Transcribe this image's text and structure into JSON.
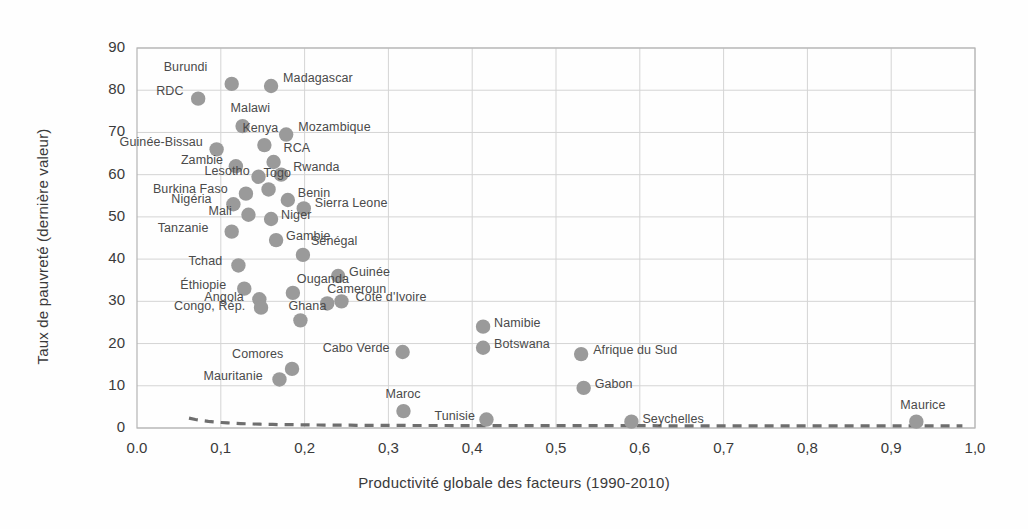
{
  "chart_data": {
    "type": "scatter",
    "title": "",
    "xlabel": "Productivité globale des facteurs (1990-2010)",
    "ylabel": "Taux de pauvreté (dernière valeur)",
    "xlim": [
      0.0,
      1.0
    ],
    "ylim": [
      0,
      90
    ],
    "xticks": [
      "0.0",
      "0,1",
      "0,2",
      "0,3",
      "0,4",
      "0,5",
      "0,6",
      "0,7",
      "0,8",
      "0,9",
      "1,0"
    ],
    "xtick_values": [
      0.0,
      0.1,
      0.2,
      0.3,
      0.4,
      0.5,
      0.6,
      0.7,
      0.8,
      0.9,
      1.0
    ],
    "yticks": [
      "0",
      "10",
      "20",
      "30",
      "40",
      "50",
      "60",
      "70",
      "80",
      "90"
    ],
    "ytick_values": [
      0,
      10,
      20,
      30,
      40,
      50,
      60,
      70,
      80,
      90
    ],
    "grid": true,
    "legend": "none",
    "marker_color": "#9a9a9a",
    "trendline": {
      "style": "dashed",
      "color": "#6e6e6e",
      "description": "Courbe de tendance décroissante"
    },
    "points": [
      {
        "label": "Burundi",
        "x": 0.113,
        "y": 81.5,
        "label_dx": -68,
        "label_dy": -17
      },
      {
        "label": "Madagascar",
        "x": 0.16,
        "y": 81.0,
        "label_dx": 12,
        "label_dy": -8
      },
      {
        "label": "RDC",
        "x": 0.073,
        "y": 78.0,
        "label_dx": -42,
        "label_dy": -8
      },
      {
        "label": "Malawi",
        "x": 0.126,
        "y": 71.5,
        "label_dx": -12,
        "label_dy": -18
      },
      {
        "label": "Mozambique",
        "x": 0.178,
        "y": 69.5,
        "label_dx": 12,
        "label_dy": -8
      },
      {
        "label": "Kenya",
        "x": 0.152,
        "y": 67.0,
        "label_dx": -22,
        "label_dy": -17
      },
      {
        "label": "Guinée-Bissau",
        "x": 0.095,
        "y": 66.0,
        "label_dx": -97,
        "label_dy": -7
      },
      {
        "label": "RCA",
        "x": 0.163,
        "y": 63.0,
        "label_dx": 10,
        "label_dy": -14
      },
      {
        "label": "Zambie",
        "x": 0.118,
        "y": 62.0,
        "label_dx": -55,
        "label_dy": -6
      },
      {
        "label": "Rwanda",
        "x": 0.172,
        "y": 60.0,
        "label_dx": 12,
        "label_dy": -8
      },
      {
        "label": "Lesotho",
        "x": 0.145,
        "y": 59.5,
        "label_dx": -54,
        "label_dy": -6
      },
      {
        "label": "Togo",
        "x": 0.157,
        "y": 56.5,
        "label_dx": -5,
        "label_dy": -16
      },
      {
        "label": "Burkina Faso",
        "x": 0.13,
        "y": 55.5,
        "label_dx": -93,
        "label_dy": -5
      },
      {
        "label": "Benin",
        "x": 0.18,
        "y": 54.0,
        "label_dx": 10,
        "label_dy": -7
      },
      {
        "label": "Nigéria",
        "x": 0.115,
        "y": 53.0,
        "label_dx": -62,
        "label_dy": -5
      },
      {
        "label": "Sierra Leone",
        "x": 0.199,
        "y": 52.0,
        "label_dx": 11,
        "label_dy": -5
      },
      {
        "label": "Mali",
        "x": 0.133,
        "y": 50.5,
        "label_dx": -40,
        "label_dy": -4
      },
      {
        "label": "Niger",
        "x": 0.16,
        "y": 49.5,
        "label_dx": 10,
        "label_dy": -4
      },
      {
        "label": "Gambie",
        "x": 0.166,
        "y": 44.5,
        "label_dx": 10,
        "label_dy": -4
      },
      {
        "label": "Tanzanie",
        "x": 0.113,
        "y": 46.5,
        "label_dx": -74,
        "label_dy": -4
      },
      {
        "label": "Sénégal",
        "x": 0.198,
        "y": 41.0,
        "label_dx": 8,
        "label_dy": -14
      },
      {
        "label": "Tchad",
        "x": 0.121,
        "y": 38.5,
        "label_dx": -50,
        "label_dy": -4
      },
      {
        "label": "Guinée",
        "x": 0.24,
        "y": 36.0,
        "label_dx": 11,
        "label_dy": -4
      },
      {
        "label": "Éthiopie",
        "x": 0.128,
        "y": 33.0,
        "label_dx": -64,
        "label_dy": -4
      },
      {
        "label": "Ouganda",
        "x": 0.186,
        "y": 32.0,
        "label_dx": 4,
        "label_dy": -14
      },
      {
        "label": "Côte d'Ivoire",
        "x": 0.244,
        "y": 30.0,
        "label_dx": 14,
        "label_dy": -4
      },
      {
        "label": "Angola",
        "x": 0.146,
        "y": 30.5,
        "label_dx": -55,
        "label_dy": -2
      },
      {
        "label": "Congo, Rép.",
        "x": 0.148,
        "y": 28.5,
        "label_dx": -87,
        "label_dy": -2
      },
      {
        "label": "Cameroun",
        "x": 0.227,
        "y": 29.5,
        "label_dx": 0,
        "label_dy": -14
      },
      {
        "label": "Namibie",
        "x": 0.413,
        "y": 24.0,
        "label_dx": 11,
        "label_dy": -4
      },
      {
        "label": "Ghana",
        "x": 0.195,
        "y": 25.5,
        "label_dx": -12,
        "label_dy": -14
      },
      {
        "label": "Botswana",
        "x": 0.413,
        "y": 19.0,
        "label_dx": 11,
        "label_dy": -4
      },
      {
        "label": "Afrique du Sud",
        "x": 0.53,
        "y": 17.5,
        "label_dx": 12,
        "label_dy": -4
      },
      {
        "label": "Cabo Verde",
        "x": 0.317,
        "y": 18.0,
        "label_dx": -80,
        "label_dy": -4
      },
      {
        "label": "Comores",
        "x": 0.185,
        "y": 14.0,
        "label_dx": -60,
        "label_dy": -15
      },
      {
        "label": "Mauritanie",
        "x": 0.17,
        "y": 11.5,
        "label_dx": -76,
        "label_dy": -3
      },
      {
        "label": "Gabon",
        "x": 0.533,
        "y": 9.5,
        "label_dx": 11,
        "label_dy": -4
      },
      {
        "label": "Maroc",
        "x": 0.318,
        "y": 4.0,
        "label_dx": -18,
        "label_dy": -17
      },
      {
        "label": "Tunisie",
        "x": 0.417,
        "y": 2.0,
        "label_dx": -52,
        "label_dy": -4
      },
      {
        "label": "Seychelles",
        "x": 0.59,
        "y": 1.5,
        "label_dx": 11,
        "label_dy": -3
      },
      {
        "label": "Maurice",
        "x": 0.93,
        "y": 1.5,
        "label_dx": -16,
        "label_dy": -17
      }
    ]
  }
}
